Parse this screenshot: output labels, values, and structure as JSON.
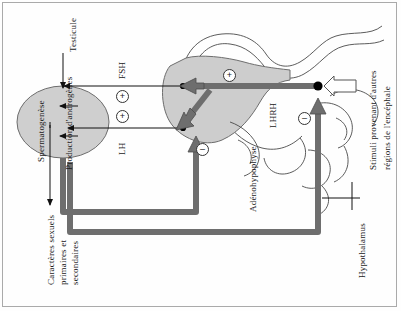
{
  "diagram": {
    "orientation": "rotated-90-ccw",
    "labels": {
      "testicule": "Testicule",
      "spermatogenese": "Spermatogenèse",
      "production_androgenes": "Production d'androgènes",
      "caracteres_line1": "Caractères sexuels",
      "caracteres_line2": "primaires et",
      "caracteres_line3": "secondaires",
      "fsh": "FSH",
      "lh": "LH",
      "adenohypophyse": "Adénohypophyse",
      "gnrh": "LHRH",
      "hypothalamus": "Hypothalamus",
      "stimuli_line1": "Stimuli provenant d'autres",
      "stimuli_line2": "régions de l'encéphale"
    },
    "signs": {
      "plus": "+",
      "minus": "–"
    },
    "sign_markers": [
      {
        "name": "plus-fsh",
        "symbol": "+",
        "x": 121,
        "y": 95
      },
      {
        "name": "plus-lh",
        "symbol": "+",
        "x": 121,
        "y": 115
      },
      {
        "name": "plus-gnrh-pituitary",
        "symbol": "+",
        "x": 223,
        "y": 70
      },
      {
        "name": "minus-pituitary-feedback",
        "symbol": "–",
        "x": 195,
        "y": 143
      },
      {
        "name": "minus-hypothalamus-feedback",
        "symbol": "–",
        "x": 298,
        "y": 112
      }
    ],
    "colors": {
      "organ_fill": "#cfcfcf",
      "organ_stroke": "#6d6d6d",
      "thick_arrow": "#6e6e6e",
      "thin_arrow": "#111111",
      "hollow_arrow_fill": "#ffffff",
      "frame": "#aaaaaa",
      "background": "#fefefe"
    }
  }
}
